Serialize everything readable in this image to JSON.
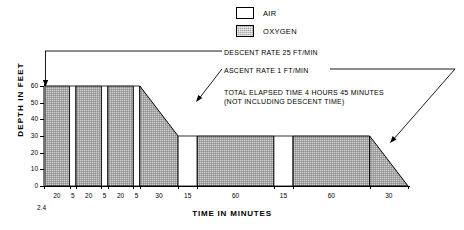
{
  "legend": {
    "items": [
      {
        "label": "AIR",
        "key": "air",
        "color": "#ffffff"
      },
      {
        "label": "OXYGEN",
        "key": "oxygen",
        "color": "#a8a8a8"
      }
    ]
  },
  "annotations": {
    "descent_rate": "DESCENT RATE 25 FT/MIN",
    "ascent_rate": "ASCENT RATE 1 FT/MIN",
    "total_time_line1": "TOTAL ELAPSED TIME 4 HOURS 45 MINUTES",
    "total_time_line2": "(NOT INCLUDING DESCENT TIME)"
  },
  "axes": {
    "ylabel": "DEPTH IN FEET",
    "xlabel": "TIME IN MINUTES",
    "yticks": [
      0,
      10,
      20,
      30,
      40,
      50,
      60
    ],
    "descent_time_marker": "2.4"
  },
  "chart_data": {
    "type": "area",
    "title": "",
    "xlabel": "TIME IN MINUTES",
    "ylabel": "DEPTH IN FEET",
    "ylim": [
      0,
      60
    ],
    "xlim": [
      0,
      335
    ],
    "grid": false,
    "legend_position": "top-center",
    "y_inverted": false,
    "tick_labels": [
      "20",
      "5",
      "20",
      "5",
      "20",
      "5",
      "30",
      "15",
      "60",
      "15",
      "60",
      "30"
    ],
    "segments": [
      {
        "duration": 20,
        "gas": "oxygen",
        "depth_start": 60,
        "depth_end": 60,
        "label": "20"
      },
      {
        "duration": 5,
        "gas": "air",
        "depth_start": 60,
        "depth_end": 60,
        "label": "5"
      },
      {
        "duration": 20,
        "gas": "oxygen",
        "depth_start": 60,
        "depth_end": 60,
        "label": "20"
      },
      {
        "duration": 5,
        "gas": "air",
        "depth_start": 60,
        "depth_end": 60,
        "label": "5"
      },
      {
        "duration": 20,
        "gas": "oxygen",
        "depth_start": 60,
        "depth_end": 60,
        "label": "20"
      },
      {
        "duration": 5,
        "gas": "air",
        "depth_start": 60,
        "depth_end": 60,
        "label": "5"
      },
      {
        "duration": 30,
        "gas": "oxygen",
        "depth_start": 60,
        "depth_end": 30,
        "label": "30"
      },
      {
        "duration": 15,
        "gas": "air",
        "depth_start": 30,
        "depth_end": 30,
        "label": "15"
      },
      {
        "duration": 60,
        "gas": "oxygen",
        "depth_start": 30,
        "depth_end": 30,
        "label": "60"
      },
      {
        "duration": 15,
        "gas": "air",
        "depth_start": 30,
        "depth_end": 30,
        "label": "15"
      },
      {
        "duration": 60,
        "gas": "oxygen",
        "depth_start": 30,
        "depth_end": 30,
        "label": "60"
      },
      {
        "duration": 30,
        "gas": "oxygen",
        "depth_start": 30,
        "depth_end": 0,
        "label": "30"
      }
    ],
    "descent_rate_ft_per_min": 25,
    "ascent_rate_ft_per_min": 1,
    "descent_time_minutes": 2.4,
    "total_elapsed_minutes": 285
  }
}
